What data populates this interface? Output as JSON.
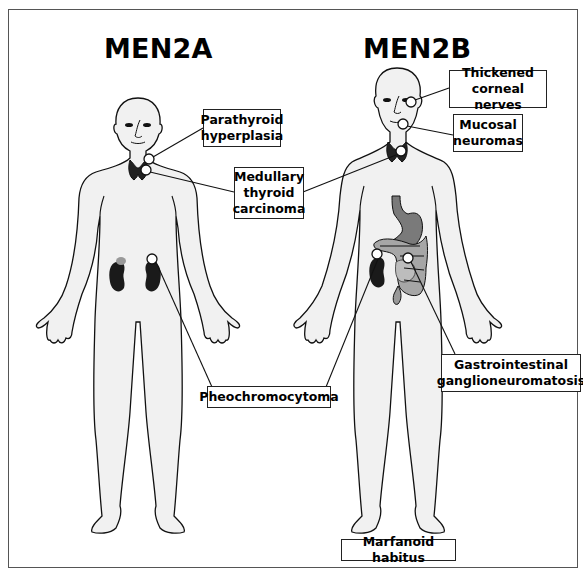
{
  "titles": {
    "left": "MEN2A",
    "right": "MEN2B"
  },
  "labels": {
    "parathyroid": "Parathyroid\nhyperplasia",
    "medullary": "Medullary\nthyroid\ncarcinoma",
    "pheo": "Pheochromocytoma",
    "corneal": "Thickened\ncorneal nerves",
    "mucosal": "Mucosal\nneuromas",
    "gi": "Gastrointestinal\nganglioneuromatosis",
    "marfanoid": "Marfanoid habitus"
  },
  "colors": {
    "body_fill": "#f1f1f1",
    "outline": "#111111",
    "organ_dark": "#1a1a1a",
    "gi_gray": "#8a8a8a",
    "adrenal_gray": "#999999"
  }
}
